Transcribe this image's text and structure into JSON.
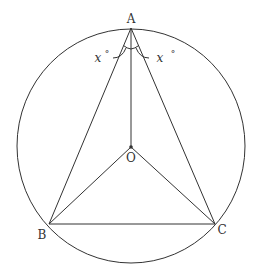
{
  "diagram": {
    "type": "geometry",
    "points": {
      "A": {
        "label": "A",
        "x": 131,
        "y": 28
      },
      "B": {
        "label": "B",
        "x": 49,
        "y": 224
      },
      "C": {
        "label": "C",
        "x": 215,
        "y": 224
      },
      "O": {
        "label": "O",
        "x": 131,
        "y": 147
      }
    },
    "circle": {
      "cx": 131,
      "cy": 146,
      "rx": 114,
      "ry": 117
    },
    "segments": [
      "AB",
      "AC",
      "BC",
      "AO",
      "OB",
      "OC"
    ],
    "angle_labels": [
      {
        "var": "x",
        "unit": "°",
        "angle": "BAO"
      },
      {
        "var": "x",
        "unit": "°",
        "angle": "OAC"
      }
    ],
    "stroke_color": "#333333"
  }
}
